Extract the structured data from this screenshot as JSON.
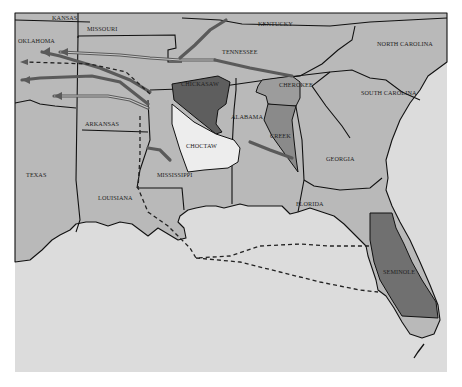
{
  "map": {
    "colors": {
      "water": "#dcdcdc",
      "land": "#b9b9b9",
      "chickasaw": "#5e5e5e",
      "choctaw": "#ededed",
      "cherokee": "#9c9c9c",
      "creek": "#8a8a8a",
      "seminole": "#707070",
      "border": "#111111",
      "trail": "#5a5a5a"
    },
    "states": [
      {
        "key": "kansas",
        "label": "KANSAS"
      },
      {
        "key": "missouri",
        "label": "MISSOURI"
      },
      {
        "key": "kentucky",
        "label": "KENTUCKY"
      },
      {
        "key": "oklahoma",
        "label": "OKLAHOMA"
      },
      {
        "key": "tennessee",
        "label": "TENNESSEE"
      },
      {
        "key": "north_carolina",
        "label": "NORTH CAROLINA"
      },
      {
        "key": "arkansas",
        "label": "ARKANSAS"
      },
      {
        "key": "alabama",
        "label": "ALABAMA"
      },
      {
        "key": "south_carolina",
        "label": "SOUTH CAROLINA"
      },
      {
        "key": "texas",
        "label": "TEXAS"
      },
      {
        "key": "mississippi",
        "label": "MISSISSIPPI"
      },
      {
        "key": "georgia",
        "label": "GEORGIA"
      },
      {
        "key": "louisiana",
        "label": "LOUISIANA"
      },
      {
        "key": "florida",
        "label": "FLORIDA"
      }
    ],
    "nations": [
      {
        "key": "chickasaw",
        "label": "CHICKASAW"
      },
      {
        "key": "cherokee",
        "label": "CHEROKEE"
      },
      {
        "key": "choctaw",
        "label": "CHOCTAW"
      },
      {
        "key": "creek",
        "label": "CREEK"
      },
      {
        "key": "seminole",
        "label": "SEMINOLE"
      }
    ],
    "labels": {
      "kansas": "KANSAS",
      "missouri": "MISSOURI",
      "kentucky": "KENTUCKY",
      "oklahoma": "OKLAHOMA",
      "tennessee": "TENNESSEE",
      "north_carolina": "NORTH CAROLINA",
      "arkansas": "ARKANSAS",
      "alabama": "ALABAMA",
      "south_carolina": "SOUTH CAROLINA",
      "texas": "TEXAS",
      "mississippi": "MISSISSIPPI",
      "georgia": "GEORGIA",
      "louisiana": "LOUISIANA",
      "florida": "FLORIDA",
      "chickasaw": "CHICKASAW",
      "cherokee": "CHEROKEE",
      "choctaw": "CHOCTAW",
      "creek": "CREEK",
      "seminole": "SEMINOLE"
    }
  }
}
